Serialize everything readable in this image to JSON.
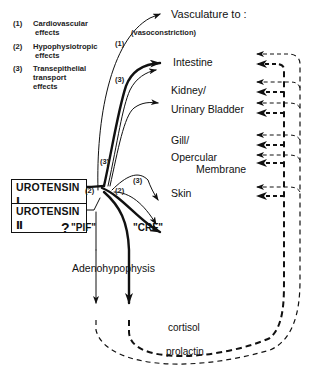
{
  "legend": [
    {
      "num": "(1)",
      "line1": "Cardiovascular",
      "line2": "effects"
    },
    {
      "num": "(2)",
      "line1": "Hypophysiotropic",
      "line2": "effects"
    },
    {
      "num": "(3)",
      "line1": "Transepithelial",
      "line2": "transport effects"
    }
  ],
  "sources": [
    {
      "label": "UROTENSIN Ⅰ"
    },
    {
      "label": "UROTENSIN Ⅱ"
    }
  ],
  "vasculature": {
    "title": "Vasculature to :",
    "note": "(vasoconstriction)"
  },
  "targets": [
    {
      "line1": "Intestine"
    },
    {
      "line1": "Kidney/",
      "line2": "Urinary Bladder"
    },
    {
      "line1": "Gill/",
      "line2": "Opercular",
      "line3": "Membrane"
    },
    {
      "line1": "Skin"
    }
  ],
  "pathway_tags": {
    "vasc": "(1)",
    "trans_upper": "(3)",
    "u2": "(3)",
    "skin": "(3)",
    "pif_path": "(2)",
    "crf_path": "(2)"
  },
  "factors": {
    "pif_question": "?",
    "pif": "\"PIF\"",
    "crf": "\"CRF\""
  },
  "pituitary": "Adenohypophysis",
  "feedback": {
    "cortisol": "cortisol",
    "prolactin": "prolactin"
  },
  "colors": {
    "ink": "#111111",
    "background": "#ffffff"
  }
}
